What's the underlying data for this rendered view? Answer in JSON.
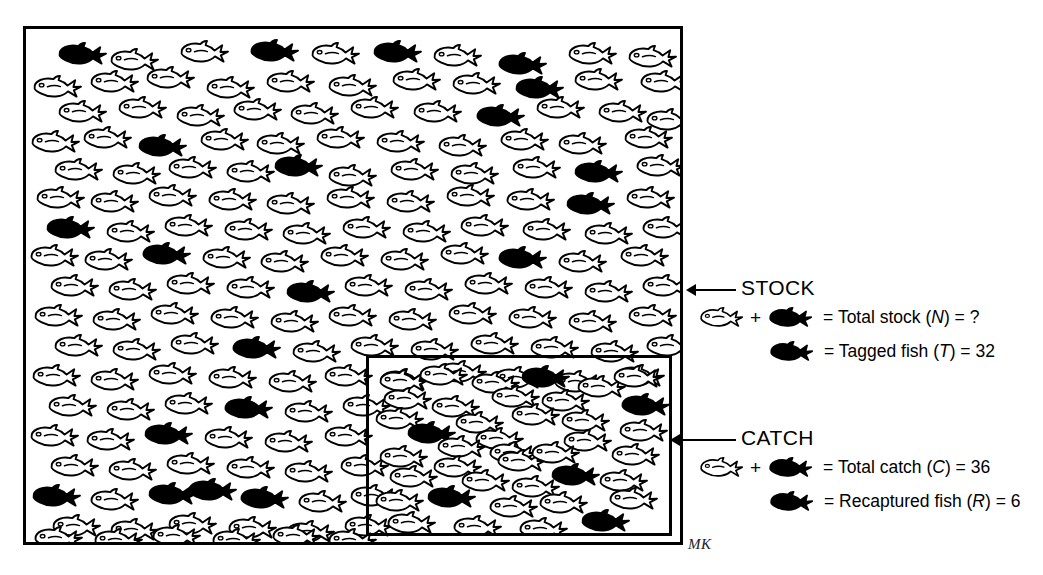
{
  "diagram": {
    "signature": "MK",
    "stock_box_label": "STOCK",
    "catch_box_label": "CATCH"
  },
  "legend": {
    "stock": {
      "label": "STOCK",
      "rows": [
        {
          "id": "total-stock",
          "icons": [
            "outline-fish-icon",
            "plus-sign",
            "black-fish-icon"
          ],
          "plus": "+",
          "text_prefix": "= Total stock (",
          "symbol": "N",
          "text_suffix": ") = ",
          "value": "?",
          "full_text": "= Total stock (N) = ?"
        },
        {
          "id": "tagged-fish",
          "icons": [
            "black-fish-icon"
          ],
          "text_prefix": "= Tagged fish (",
          "symbol": "T",
          "text_suffix": ") = ",
          "value": "32",
          "full_text": "= Tagged fish (T) = 32"
        }
      ]
    },
    "catch": {
      "label": "CATCH",
      "rows": [
        {
          "id": "total-catch",
          "icons": [
            "outline-fish-icon",
            "plus-sign",
            "black-fish-icon"
          ],
          "plus": "+",
          "text_prefix": "= Total catch (",
          "symbol": "C",
          "text_suffix": ") = ",
          "value": "36",
          "full_text": "= Total catch (C) = 36"
        },
        {
          "id": "recaptured-fish",
          "icons": [
            "black-fish-icon"
          ],
          "text_prefix": "= Recaptured fish (",
          "symbol": "R",
          "text_suffix": ") = ",
          "value": "6",
          "full_text": "= Recaptured fish (R) = 6"
        }
      ]
    }
  },
  "chart_data": {
    "type": "diagram",
    "quantities": [
      {
        "symbol": "N",
        "name": "Total stock",
        "value": "?"
      },
      {
        "symbol": "T",
        "name": "Tagged fish",
        "value": 32
      },
      {
        "symbol": "C",
        "name": "Total catch",
        "value": 36
      },
      {
        "symbol": "R",
        "name": "Recaptured fish",
        "value": 6
      }
    ],
    "colors": {
      "tagged": "#000000",
      "untagged_outline": "#000000",
      "background": "#ffffff"
    }
  },
  "fish_field": {
    "note": "positions in px relative to the stock box interior; tagged=true renders solid black",
    "stock": [
      {
        "x": 30,
        "y": 12,
        "tagged": true
      },
      {
        "x": 82,
        "y": 18,
        "tagged": false
      },
      {
        "x": 152,
        "y": 10,
        "tagged": false
      },
      {
        "x": 222,
        "y": 9,
        "tagged": true
      },
      {
        "x": 283,
        "y": 12,
        "tagged": false
      },
      {
        "x": 345,
        "y": 10,
        "tagged": true
      },
      {
        "x": 405,
        "y": 14,
        "tagged": false
      },
      {
        "x": 470,
        "y": 22,
        "tagged": true
      },
      {
        "x": 540,
        "y": 12,
        "tagged": false
      },
      {
        "x": 600,
        "y": 15,
        "tagged": false
      },
      {
        "x": 5,
        "y": 45,
        "tagged": false
      },
      {
        "x": 62,
        "y": 40,
        "tagged": false
      },
      {
        "x": 118,
        "y": 36,
        "tagged": false
      },
      {
        "x": 178,
        "y": 46,
        "tagged": false
      },
      {
        "x": 238,
        "y": 40,
        "tagged": false
      },
      {
        "x": 300,
        "y": 44,
        "tagged": false
      },
      {
        "x": 364,
        "y": 38,
        "tagged": false
      },
      {
        "x": 424,
        "y": 42,
        "tagged": false
      },
      {
        "x": 487,
        "y": 46,
        "tagged": true
      },
      {
        "x": 546,
        "y": 38,
        "tagged": false
      },
      {
        "x": 612,
        "y": 40,
        "tagged": false
      },
      {
        "x": 30,
        "y": 70,
        "tagged": false
      },
      {
        "x": 90,
        "y": 66,
        "tagged": false
      },
      {
        "x": 148,
        "y": 74,
        "tagged": false
      },
      {
        "x": 205,
        "y": 68,
        "tagged": false
      },
      {
        "x": 262,
        "y": 72,
        "tagged": false
      },
      {
        "x": 322,
        "y": 66,
        "tagged": false
      },
      {
        "x": 385,
        "y": 70,
        "tagged": false
      },
      {
        "x": 448,
        "y": 74,
        "tagged": true
      },
      {
        "x": 508,
        "y": 66,
        "tagged": false
      },
      {
        "x": 570,
        "y": 70,
        "tagged": false
      },
      {
        "x": 618,
        "y": 78,
        "tagged": false
      },
      {
        "x": 3,
        "y": 100,
        "tagged": false
      },
      {
        "x": 55,
        "y": 96,
        "tagged": false
      },
      {
        "x": 110,
        "y": 104,
        "tagged": true
      },
      {
        "x": 172,
        "y": 98,
        "tagged": false
      },
      {
        "x": 228,
        "y": 102,
        "tagged": false
      },
      {
        "x": 288,
        "y": 96,
        "tagged": false
      },
      {
        "x": 348,
        "y": 100,
        "tagged": false
      },
      {
        "x": 410,
        "y": 104,
        "tagged": false
      },
      {
        "x": 472,
        "y": 98,
        "tagged": false
      },
      {
        "x": 530,
        "y": 102,
        "tagged": false
      },
      {
        "x": 596,
        "y": 96,
        "tagged": false
      },
      {
        "x": 26,
        "y": 128,
        "tagged": false
      },
      {
        "x": 84,
        "y": 132,
        "tagged": false
      },
      {
        "x": 140,
        "y": 126,
        "tagged": false
      },
      {
        "x": 198,
        "y": 130,
        "tagged": false
      },
      {
        "x": 246,
        "y": 124,
        "tagged": true
      },
      {
        "x": 300,
        "y": 134,
        "tagged": false
      },
      {
        "x": 362,
        "y": 128,
        "tagged": false
      },
      {
        "x": 422,
        "y": 132,
        "tagged": false
      },
      {
        "x": 484,
        "y": 126,
        "tagged": false
      },
      {
        "x": 546,
        "y": 130,
        "tagged": true
      },
      {
        "x": 608,
        "y": 124,
        "tagged": false
      },
      {
        "x": 8,
        "y": 156,
        "tagged": false
      },
      {
        "x": 62,
        "y": 160,
        "tagged": false
      },
      {
        "x": 120,
        "y": 154,
        "tagged": false
      },
      {
        "x": 180,
        "y": 158,
        "tagged": false
      },
      {
        "x": 238,
        "y": 162,
        "tagged": false
      },
      {
        "x": 298,
        "y": 156,
        "tagged": false
      },
      {
        "x": 358,
        "y": 160,
        "tagged": false
      },
      {
        "x": 418,
        "y": 154,
        "tagged": false
      },
      {
        "x": 478,
        "y": 158,
        "tagged": false
      },
      {
        "x": 538,
        "y": 162,
        "tagged": true
      },
      {
        "x": 598,
        "y": 156,
        "tagged": false
      },
      {
        "x": 18,
        "y": 186,
        "tagged": true
      },
      {
        "x": 78,
        "y": 190,
        "tagged": false
      },
      {
        "x": 136,
        "y": 184,
        "tagged": false
      },
      {
        "x": 196,
        "y": 188,
        "tagged": false
      },
      {
        "x": 254,
        "y": 192,
        "tagged": false
      },
      {
        "x": 314,
        "y": 186,
        "tagged": false
      },
      {
        "x": 374,
        "y": 190,
        "tagged": false
      },
      {
        "x": 432,
        "y": 184,
        "tagged": false
      },
      {
        "x": 494,
        "y": 188,
        "tagged": false
      },
      {
        "x": 556,
        "y": 192,
        "tagged": false
      },
      {
        "x": 614,
        "y": 186,
        "tagged": false
      },
      {
        "x": 2,
        "y": 214,
        "tagged": false
      },
      {
        "x": 56,
        "y": 218,
        "tagged": false
      },
      {
        "x": 114,
        "y": 212,
        "tagged": true
      },
      {
        "x": 174,
        "y": 216,
        "tagged": false
      },
      {
        "x": 232,
        "y": 220,
        "tagged": false
      },
      {
        "x": 292,
        "y": 214,
        "tagged": false
      },
      {
        "x": 352,
        "y": 218,
        "tagged": false
      },
      {
        "x": 412,
        "y": 212,
        "tagged": false
      },
      {
        "x": 470,
        "y": 216,
        "tagged": true
      },
      {
        "x": 530,
        "y": 220,
        "tagged": false
      },
      {
        "x": 592,
        "y": 214,
        "tagged": false
      },
      {
        "x": 22,
        "y": 244,
        "tagged": false
      },
      {
        "x": 80,
        "y": 248,
        "tagged": false
      },
      {
        "x": 138,
        "y": 242,
        "tagged": false
      },
      {
        "x": 198,
        "y": 246,
        "tagged": false
      },
      {
        "x": 258,
        "y": 250,
        "tagged": true
      },
      {
        "x": 316,
        "y": 244,
        "tagged": false
      },
      {
        "x": 376,
        "y": 248,
        "tagged": false
      },
      {
        "x": 436,
        "y": 242,
        "tagged": false
      },
      {
        "x": 496,
        "y": 246,
        "tagged": false
      },
      {
        "x": 556,
        "y": 250,
        "tagged": false
      },
      {
        "x": 614,
        "y": 244,
        "tagged": false
      },
      {
        "x": 6,
        "y": 274,
        "tagged": false
      },
      {
        "x": 64,
        "y": 278,
        "tagged": false
      },
      {
        "x": 122,
        "y": 272,
        "tagged": false
      },
      {
        "x": 182,
        "y": 276,
        "tagged": false
      },
      {
        "x": 242,
        "y": 280,
        "tagged": false
      },
      {
        "x": 300,
        "y": 274,
        "tagged": false
      },
      {
        "x": 360,
        "y": 278,
        "tagged": false
      },
      {
        "x": 420,
        "y": 272,
        "tagged": false
      },
      {
        "x": 480,
        "y": 276,
        "tagged": false
      },
      {
        "x": 540,
        "y": 280,
        "tagged": false
      },
      {
        "x": 600,
        "y": 274,
        "tagged": false
      },
      {
        "x": 26,
        "y": 304,
        "tagged": false
      },
      {
        "x": 84,
        "y": 308,
        "tagged": false
      },
      {
        "x": 142,
        "y": 302,
        "tagged": false
      },
      {
        "x": 204,
        "y": 306,
        "tagged": true
      },
      {
        "x": 264,
        "y": 310,
        "tagged": false
      },
      {
        "x": 322,
        "y": 304,
        "tagged": false
      },
      {
        "x": 382,
        "y": 308,
        "tagged": false
      },
      {
        "x": 442,
        "y": 302,
        "tagged": false
      },
      {
        "x": 502,
        "y": 306,
        "tagged": false
      },
      {
        "x": 562,
        "y": 310,
        "tagged": false
      },
      {
        "x": 618,
        "y": 304,
        "tagged": false
      },
      {
        "x": 4,
        "y": 334,
        "tagged": false
      },
      {
        "x": 62,
        "y": 338,
        "tagged": false
      },
      {
        "x": 120,
        "y": 332,
        "tagged": false
      },
      {
        "x": 180,
        "y": 336,
        "tagged": false
      },
      {
        "x": 240,
        "y": 340,
        "tagged": false
      },
      {
        "x": 296,
        "y": 334,
        "tagged": false
      },
      {
        "x": 352,
        "y": 338,
        "tagged": false
      },
      {
        "x": 410,
        "y": 330,
        "tagged": false
      },
      {
        "x": 466,
        "y": 336,
        "tagged": false
      },
      {
        "x": 526,
        "y": 340,
        "tagged": false
      },
      {
        "x": 588,
        "y": 334,
        "tagged": false
      },
      {
        "x": 20,
        "y": 364,
        "tagged": false
      },
      {
        "x": 78,
        "y": 368,
        "tagged": false
      },
      {
        "x": 136,
        "y": 362,
        "tagged": false
      },
      {
        "x": 196,
        "y": 366,
        "tagged": true
      },
      {
        "x": 256,
        "y": 370,
        "tagged": false
      },
      {
        "x": 314,
        "y": 364,
        "tagged": false
      },
      {
        "x": 2,
        "y": 394,
        "tagged": false
      },
      {
        "x": 58,
        "y": 398,
        "tagged": false
      },
      {
        "x": 116,
        "y": 392,
        "tagged": true
      },
      {
        "x": 176,
        "y": 396,
        "tagged": false
      },
      {
        "x": 236,
        "y": 400,
        "tagged": false
      },
      {
        "x": 296,
        "y": 394,
        "tagged": false
      },
      {
        "x": 22,
        "y": 424,
        "tagged": false
      },
      {
        "x": 80,
        "y": 428,
        "tagged": false
      },
      {
        "x": 138,
        "y": 422,
        "tagged": false
      },
      {
        "x": 198,
        "y": 426,
        "tagged": false
      },
      {
        "x": 256,
        "y": 430,
        "tagged": false
      },
      {
        "x": 312,
        "y": 424,
        "tagged": false
      },
      {
        "x": 4,
        "y": 454,
        "tagged": true
      },
      {
        "x": 62,
        "y": 458,
        "tagged": false
      },
      {
        "x": 120,
        "y": 452,
        "tagged": true
      },
      {
        "x": 160,
        "y": 448,
        "tagged": true
      },
      {
        "x": 212,
        "y": 456,
        "tagged": true
      },
      {
        "x": 270,
        "y": 460,
        "tagged": false
      },
      {
        "x": 322,
        "y": 454,
        "tagged": false
      },
      {
        "x": 24,
        "y": 484,
        "tagged": false
      },
      {
        "x": 82,
        "y": 488,
        "tagged": false
      },
      {
        "x": 140,
        "y": 482,
        "tagged": false
      },
      {
        "x": 200,
        "y": 486,
        "tagged": false
      },
      {
        "x": 258,
        "y": 490,
        "tagged": false
      },
      {
        "x": 316,
        "y": 484,
        "tagged": false
      },
      {
        "x": 6,
        "y": 496,
        "tagged": false
      },
      {
        "x": 66,
        "y": 498,
        "tagged": false
      },
      {
        "x": 124,
        "y": 494,
        "tagged": false
      },
      {
        "x": 184,
        "y": 498,
        "tagged": false
      },
      {
        "x": 244,
        "y": 494,
        "tagged": false
      },
      {
        "x": 300,
        "y": 498,
        "tagged": false
      }
    ],
    "catch": [
      {
        "x": 8,
        "y": 10,
        "tagged": false
      },
      {
        "x": 48,
        "y": 4,
        "tagged": false
      },
      {
        "x": 100,
        "y": 12,
        "tagged": false
      },
      {
        "x": 150,
        "y": 6,
        "tagged": true
      },
      {
        "x": 206,
        "y": 16,
        "tagged": false
      },
      {
        "x": 242,
        "y": 6,
        "tagged": false
      },
      {
        "x": 12,
        "y": 28,
        "tagged": false
      },
      {
        "x": 60,
        "y": 36,
        "tagged": false
      },
      {
        "x": 120,
        "y": 26,
        "tagged": false
      },
      {
        "x": 170,
        "y": 30,
        "tagged": false
      },
      {
        "x": 250,
        "y": 34,
        "tagged": true
      },
      {
        "x": 4,
        "y": 48,
        "tagged": false
      },
      {
        "x": 84,
        "y": 52,
        "tagged": false
      },
      {
        "x": 140,
        "y": 44,
        "tagged": false
      },
      {
        "x": 190,
        "y": 50,
        "tagged": false
      },
      {
        "x": 248,
        "y": 60,
        "tagged": false
      },
      {
        "x": 36,
        "y": 62,
        "tagged": true
      },
      {
        "x": 104,
        "y": 68,
        "tagged": false
      },
      {
        "x": 66,
        "y": 76,
        "tagged": false
      },
      {
        "x": 118,
        "y": 82,
        "tagged": false
      },
      {
        "x": 192,
        "y": 70,
        "tagged": false
      },
      {
        "x": 8,
        "y": 86,
        "tagged": false
      },
      {
        "x": 62,
        "y": 96,
        "tagged": false
      },
      {
        "x": 126,
        "y": 90,
        "tagged": false
      },
      {
        "x": 160,
        "y": 82,
        "tagged": false
      },
      {
        "x": 240,
        "y": 84,
        "tagged": false
      },
      {
        "x": 18,
        "y": 106,
        "tagged": false
      },
      {
        "x": 90,
        "y": 110,
        "tagged": false
      },
      {
        "x": 140,
        "y": 116,
        "tagged": false
      },
      {
        "x": 180,
        "y": 104,
        "tagged": true
      },
      {
        "x": 228,
        "y": 110,
        "tagged": false
      },
      {
        "x": 4,
        "y": 130,
        "tagged": false
      },
      {
        "x": 56,
        "y": 126,
        "tagged": true
      },
      {
        "x": 118,
        "y": 136,
        "tagged": false
      },
      {
        "x": 168,
        "y": 132,
        "tagged": false
      },
      {
        "x": 238,
        "y": 128,
        "tagged": false
      },
      {
        "x": 16,
        "y": 152,
        "tagged": false
      },
      {
        "x": 82,
        "y": 156,
        "tagged": false
      },
      {
        "x": 148,
        "y": 158,
        "tagged": false
      },
      {
        "x": 210,
        "y": 150,
        "tagged": true
      }
    ]
  }
}
